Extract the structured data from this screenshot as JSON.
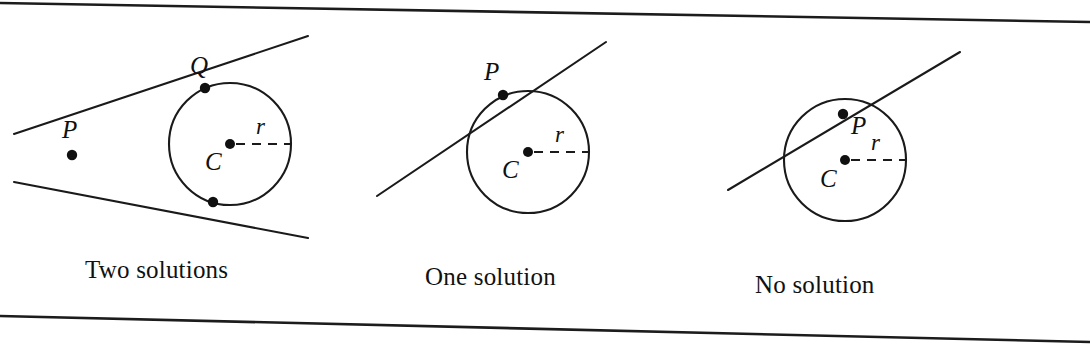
{
  "figure": {
    "width": 1090,
    "height": 345,
    "background_color": "#ffffff",
    "ink_color": "#1a1a1a",
    "top_rule": {
      "x1": 0,
      "y1": 3,
      "x2": 1090,
      "y2": 22
    },
    "bottom_rule": {
      "x1": 0,
      "y1": 316,
      "x2": 1090,
      "y2": 342
    }
  },
  "panels": [
    {
      "id": "two-solutions",
      "caption": "Two solutions",
      "caption_x": 85,
      "caption_y": 278,
      "circle": {
        "cx": 230,
        "cy": 144,
        "r": 61
      },
      "center_label": "C",
      "center_label_x": 205,
      "center_label_y": 170,
      "radius_label": "r",
      "radius_label_x": 256,
      "radius_label_y": 134,
      "radius_dash": {
        "x1": 236,
        "y1": 144,
        "x2": 291,
        "y2": 144
      },
      "lines": [
        {
          "name": "upper-secant",
          "x1": 14,
          "y1": 134,
          "x2": 308,
          "y2": 36
        },
        {
          "name": "lower-secant",
          "x1": 14,
          "y1": 182,
          "x2": 308,
          "y2": 238
        }
      ],
      "points": [
        {
          "name": "P",
          "label": "P",
          "x": 72,
          "y": 155,
          "label_x": 62,
          "label_y": 138,
          "show_label": true
        },
        {
          "name": "Q",
          "label": "Q",
          "x": 205,
          "y": 88,
          "label_x": 190,
          "label_y": 74,
          "show_label": true
        },
        {
          "name": "tangent-lower",
          "label": "",
          "x": 213,
          "y": 202,
          "label_x": 0,
          "label_y": 0,
          "show_label": false
        }
      ]
    },
    {
      "id": "one-solution",
      "caption": "One solution",
      "caption_x": 425,
      "caption_y": 285,
      "circle": {
        "cx": 528,
        "cy": 152,
        "r": 61
      },
      "center_label": "C",
      "center_label_x": 502,
      "center_label_y": 178,
      "radius_label": "r",
      "radius_label_x": 555,
      "radius_label_y": 142,
      "radius_dash": {
        "x1": 534,
        "y1": 152,
        "x2": 589,
        "y2": 152
      },
      "lines": [
        {
          "name": "tangent-line",
          "x1": 377,
          "y1": 196,
          "x2": 606,
          "y2": 42
        }
      ],
      "points": [
        {
          "name": "P",
          "label": "P",
          "x": 503,
          "y": 95,
          "label_x": 484,
          "label_y": 80,
          "show_label": true
        }
      ]
    },
    {
      "id": "no-solution",
      "caption": "No solution",
      "caption_x": 755,
      "caption_y": 293,
      "circle": {
        "cx": 845,
        "cy": 160,
        "r": 61
      },
      "center_label": "C",
      "center_label_x": 820,
      "center_label_y": 187,
      "radius_label": "r",
      "radius_label_x": 871,
      "radius_label_y": 150,
      "radius_dash": {
        "x1": 851,
        "y1": 160,
        "x2": 906,
        "y2": 160
      },
      "lines": [
        {
          "name": "secant-line",
          "x1": 728,
          "y1": 190,
          "x2": 960,
          "y2": 52
        }
      ],
      "points": [
        {
          "name": "P",
          "label": "P",
          "x": 843,
          "y": 114,
          "label_x": 851,
          "label_y": 134,
          "show_label": true
        }
      ]
    }
  ]
}
